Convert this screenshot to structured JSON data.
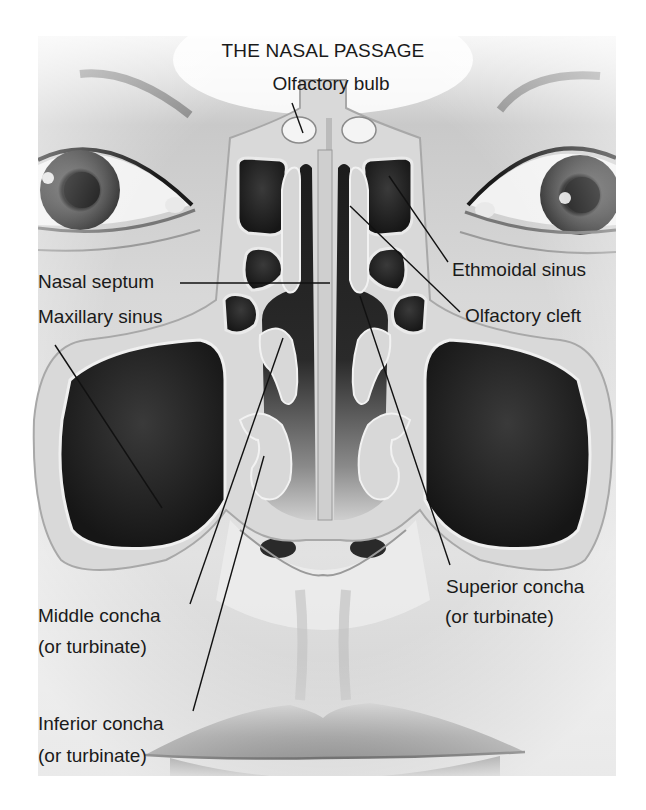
{
  "diagram": {
    "title": "THE NASAL PASSAGE",
    "labels": {
      "olfactory_bulb": "Olfactory bulb",
      "nasal_septum": "Nasal septum",
      "ethmoidal_sinus": "Ethmoidal sinus",
      "olfactory_cleft": "Olfactory cleft",
      "maxillary_sinus": "Maxillary sinus",
      "superior_concha": {
        "line1": "Superior concha",
        "line2": "(or turbinate)"
      },
      "middle_concha": {
        "line1": "Middle concha",
        "line2": "(or turbinate)"
      },
      "inferior_concha": {
        "line1": "Inferior concha",
        "line2": "(or turbinate)"
      }
    },
    "colors": {
      "background": "#ffffff",
      "skin_light": "#e6e6e6",
      "skin_mid": "#b8b8b8",
      "cavity_dark": "#1e1e1e",
      "bone": "#d4d4d4",
      "text": "#1a1a1a"
    }
  }
}
